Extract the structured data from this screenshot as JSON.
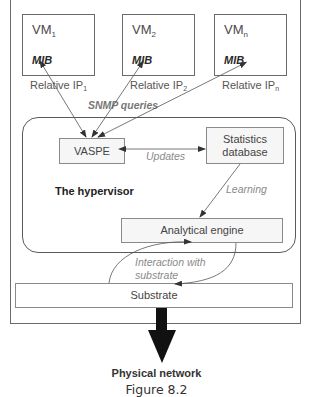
{
  "diagram": {
    "vms": [
      {
        "name": "VM",
        "subscript": "1",
        "mib": "MIB",
        "ip_label": "Relative IP",
        "ip_subscript": "1"
      },
      {
        "name": "VM",
        "subscript": "2",
        "mib": "MIB",
        "ip_label": "Relative IP",
        "ip_subscript": "2"
      },
      {
        "name": "VM",
        "subscript": "n",
        "mib": "MIB",
        "ip_label": "Relative IP",
        "ip_subscript": "n"
      }
    ],
    "snmp_label": "SNMP queries",
    "vaspe_label": "VASPE",
    "updates_label": "Updates",
    "stats_db_line1": "Statistics",
    "stats_db_line2": "database",
    "hypervisor_label": "The hypervisor",
    "learning_label": "Learning",
    "analytical_engine_label": "Analytical engine",
    "interaction_line1": "Interaction with",
    "interaction_line2": "substrate",
    "substrate_label": "Substrate",
    "physical_network_label": "Physical network",
    "figure_caption": "Figure 8.2"
  },
  "colors": {
    "border": "#6a6a6a",
    "box_fill": "#f6f6f6",
    "arrow": "#111111",
    "label_gray": "#8a8a8a"
  }
}
